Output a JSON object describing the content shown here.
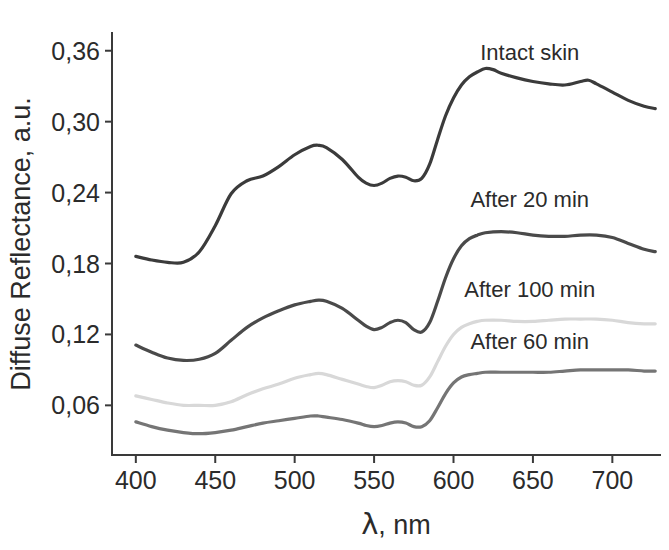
{
  "chart_data": {
    "type": "line",
    "title": "",
    "xlabel": "λ, nm",
    "ylabel": "Diffuse Reflectance, a.u.",
    "xlim": [
      385,
      730
    ],
    "ylim": [
      0.018,
      0.375
    ],
    "xticks": [
      400,
      450,
      500,
      550,
      600,
      650,
      700
    ],
    "xtick_labels": [
      "400",
      "450",
      "500",
      "550",
      "600",
      "650",
      "700"
    ],
    "yticks": [
      0.06,
      0.12,
      0.18,
      0.24,
      0.3,
      0.36
    ],
    "ytick_labels": [
      "0,06",
      "0,12",
      "0,18",
      "0,24",
      "0,30",
      "0,36"
    ],
    "grid": false,
    "legend_position": "inline-annotations",
    "decimal_separator": ",",
    "series": [
      {
        "name": "Intact skin",
        "color": "#3b3b3b",
        "label_x": 648,
        "label_y": 0.352,
        "x": [
          400,
          410,
          420,
          430,
          440,
          450,
          460,
          470,
          480,
          490,
          500,
          510,
          515,
          520,
          530,
          540,
          545,
          550,
          555,
          560,
          565,
          570,
          575,
          580,
          585,
          590,
          595,
          600,
          605,
          610,
          615,
          620,
          625,
          630,
          640,
          650,
          660,
          670,
          680,
          685,
          690,
          700,
          710,
          720,
          727
        ],
        "y": [
          0.186,
          0.183,
          0.181,
          0.181,
          0.19,
          0.212,
          0.239,
          0.25,
          0.254,
          0.262,
          0.272,
          0.279,
          0.28,
          0.278,
          0.268,
          0.253,
          0.248,
          0.246,
          0.248,
          0.252,
          0.254,
          0.253,
          0.25,
          0.252,
          0.264,
          0.285,
          0.305,
          0.32,
          0.331,
          0.338,
          0.342,
          0.345,
          0.344,
          0.341,
          0.337,
          0.334,
          0.332,
          0.331,
          0.334,
          0.335,
          0.332,
          0.325,
          0.318,
          0.313,
          0.311
        ]
      },
      {
        "name": "After 20 min",
        "color": "#4a4a4a",
        "label_x": 648,
        "label_y": 0.228,
        "x": [
          400,
          410,
          420,
          430,
          440,
          450,
          460,
          470,
          480,
          490,
          500,
          510,
          515,
          520,
          530,
          540,
          545,
          550,
          555,
          560,
          565,
          570,
          575,
          580,
          585,
          590,
          595,
          600,
          605,
          610,
          615,
          620,
          630,
          640,
          650,
          660,
          670,
          680,
          690,
          700,
          710,
          720,
          727
        ],
        "y": [
          0.111,
          0.105,
          0.1,
          0.098,
          0.099,
          0.104,
          0.115,
          0.126,
          0.134,
          0.14,
          0.145,
          0.148,
          0.149,
          0.148,
          0.142,
          0.132,
          0.127,
          0.124,
          0.126,
          0.13,
          0.132,
          0.13,
          0.124,
          0.122,
          0.13,
          0.148,
          0.168,
          0.184,
          0.195,
          0.201,
          0.204,
          0.206,
          0.207,
          0.206,
          0.204,
          0.203,
          0.203,
          0.204,
          0.204,
          0.202,
          0.197,
          0.192,
          0.19
        ]
      },
      {
        "name": "After 100 min",
        "color": "#d8d8d8",
        "label_x": 648,
        "label_y": 0.152,
        "x": [
          400,
          410,
          420,
          430,
          440,
          450,
          460,
          470,
          480,
          490,
          500,
          510,
          515,
          520,
          530,
          540,
          545,
          550,
          555,
          560,
          565,
          570,
          575,
          580,
          585,
          590,
          595,
          600,
          605,
          610,
          615,
          620,
          630,
          640,
          650,
          660,
          670,
          680,
          690,
          700,
          710,
          720,
          727
        ],
        "y": [
          0.068,
          0.065,
          0.062,
          0.06,
          0.06,
          0.06,
          0.063,
          0.069,
          0.074,
          0.078,
          0.083,
          0.086,
          0.087,
          0.086,
          0.082,
          0.078,
          0.076,
          0.075,
          0.077,
          0.08,
          0.081,
          0.08,
          0.077,
          0.077,
          0.084,
          0.097,
          0.11,
          0.12,
          0.126,
          0.129,
          0.131,
          0.132,
          0.132,
          0.131,
          0.131,
          0.132,
          0.133,
          0.133,
          0.133,
          0.132,
          0.13,
          0.129,
          0.129
        ]
      },
      {
        "name": "After 60 min",
        "color": "#757575",
        "label_x": 648,
        "label_y": 0.108,
        "x": [
          400,
          410,
          420,
          430,
          440,
          450,
          460,
          470,
          480,
          490,
          500,
          510,
          515,
          520,
          530,
          540,
          545,
          550,
          555,
          560,
          565,
          570,
          575,
          580,
          585,
          590,
          595,
          600,
          605,
          610,
          615,
          620,
          630,
          640,
          650,
          660,
          670,
          680,
          690,
          700,
          710,
          720,
          727
        ],
        "y": [
          0.046,
          0.042,
          0.039,
          0.037,
          0.036,
          0.037,
          0.039,
          0.042,
          0.045,
          0.047,
          0.049,
          0.051,
          0.051,
          0.05,
          0.048,
          0.045,
          0.043,
          0.042,
          0.043,
          0.045,
          0.046,
          0.045,
          0.042,
          0.042,
          0.047,
          0.058,
          0.07,
          0.079,
          0.084,
          0.086,
          0.087,
          0.088,
          0.088,
          0.088,
          0.088,
          0.088,
          0.089,
          0.09,
          0.09,
          0.09,
          0.09,
          0.089,
          0.089
        ]
      }
    ]
  },
  "axes": {
    "y_title": "Diffuse Reflectance, a.u.",
    "x_title_symbol": "λ",
    "x_title_rest": ", nm"
  },
  "colors": {
    "axis": "#3a3a3a",
    "text": "#2b2b2b",
    "background": "#ffffff"
  }
}
